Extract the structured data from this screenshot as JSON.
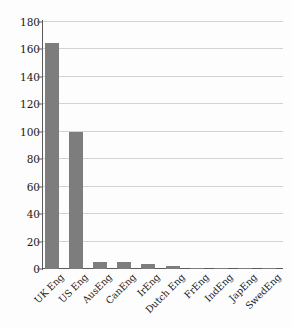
{
  "chart_data": {
    "type": "bar",
    "title": "",
    "subtitle": "",
    "xlabel": "",
    "ylabel": "",
    "categories": [
      "UK Eng",
      "US Eng",
      "AusEng",
      "CanEng",
      "IrEng",
      "Dutch Eng",
      "FrEng",
      "IndEng",
      "JapEng",
      "SwedEng"
    ],
    "values": [
      165,
      100,
      5,
      5,
      3.5,
      2,
      1,
      1,
      1,
      1
    ],
    "series": [
      {
        "name": "",
        "values": [
          165,
          100,
          5,
          5,
          3.5,
          2,
          1,
          1,
          1,
          1
        ]
      }
    ],
    "ylim": [
      0,
      180
    ],
    "yticks": [
      0,
      20,
      40,
      60,
      80,
      100,
      120,
      140,
      160,
      180
    ],
    "ytick_labels": [
      "0",
      "20",
      "40",
      "60",
      "80",
      "100",
      "120",
      "140",
      "160",
      "180"
    ],
    "grid": true,
    "grid_axis": "y",
    "legend": false,
    "legend_position": "none",
    "bar_color": "#7d7d7d",
    "grid_color": "#d2d2d2",
    "axis_color": "#5a5a5a",
    "background_color": "#fdfdfd",
    "xtick_rotation": -45,
    "annotations": []
  }
}
